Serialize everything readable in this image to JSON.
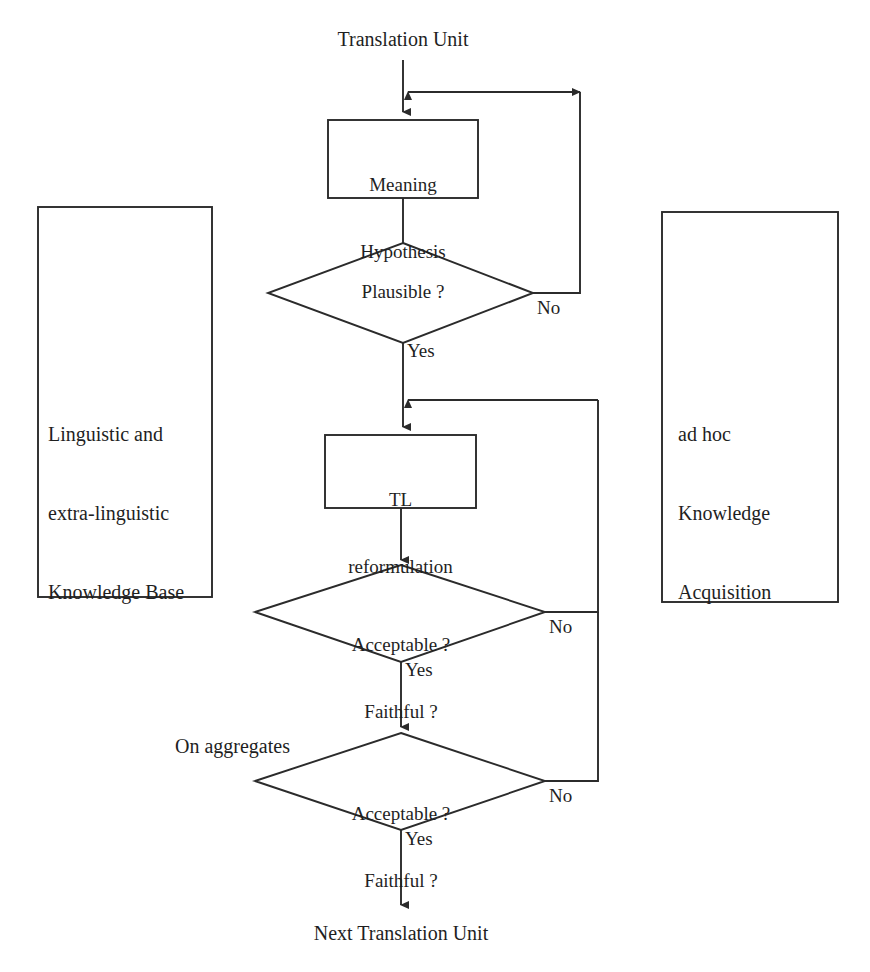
{
  "diagram": {
    "stroke_color": "#2b2b2b",
    "text_color": "#1f1f1f",
    "background_color": "#ffffff"
  },
  "entry": {
    "label": "Translation Unit"
  },
  "exit": {
    "label": "Next Translation Unit"
  },
  "side_panels": {
    "left": {
      "line1": "Linguistic and",
      "line2": "extra-linguistic",
      "line3": "Knowledge Base"
    },
    "right": {
      "line1": "ad hoc",
      "line2": "Knowledge",
      "line3": "Acquisition"
    }
  },
  "process_nodes": [
    {
      "id": "meaning-hypothesis",
      "line1": "Meaning",
      "line2": "Hypothesis"
    },
    {
      "id": "tl-reformulation",
      "line1": "TL",
      "line2": "reformulation"
    }
  ],
  "decision_nodes": [
    {
      "id": "plausible",
      "line1": "Plausible ?",
      "line2": "",
      "yes_label": "Yes",
      "no_label": "No"
    },
    {
      "id": "acceptable-faithful-1",
      "line1": "Acceptable ?",
      "line2": "Faithful ?",
      "yes_label": "Yes",
      "no_label": "No"
    },
    {
      "id": "acceptable-faithful-2",
      "line1": "Acceptable ?",
      "line2": "Faithful ?",
      "yes_label": "Yes",
      "no_label": "No"
    }
  ],
  "annotations": {
    "on_aggregates": "On aggregates"
  }
}
